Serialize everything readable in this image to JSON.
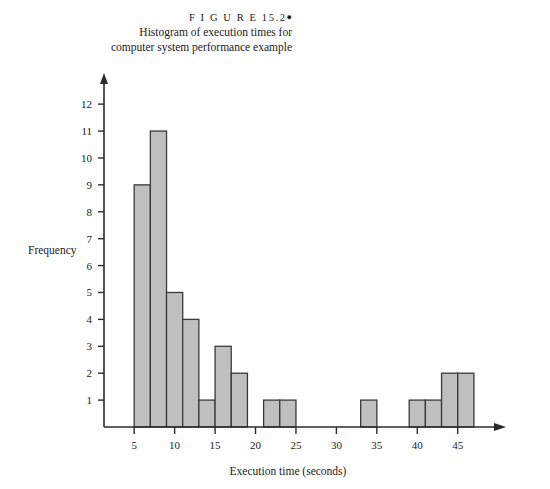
{
  "caption": {
    "figure_label": "F I G U R E  15.2",
    "bullet": "●",
    "line1": "Histogram of execution times for",
    "line2": "computer system performance example"
  },
  "colors": {
    "bar_fill": "#bfbfbf",
    "bar_stroke": "#3a3a3a",
    "axis": "#2b2b2b",
    "background": "#ffffff",
    "text": "#1a1a1a"
  },
  "chart_data": {
    "type": "bar",
    "title": "Histogram of execution times for computer system performance example",
    "xlabel": "Execution time (seconds)",
    "ylabel": "Frequency",
    "xlim": [
      3,
      48
    ],
    "ylim": [
      0,
      12.6
    ],
    "grid": false,
    "legend": null,
    "bin_width": 2,
    "xticks": [
      5,
      10,
      15,
      20,
      25,
      30,
      35,
      40,
      45
    ],
    "yticks": [
      1,
      2,
      3,
      4,
      5,
      6,
      7,
      8,
      9,
      10,
      11,
      12
    ],
    "bins": [
      {
        "start": 5,
        "end": 7,
        "value": 9
      },
      {
        "start": 7,
        "end": 9,
        "value": 11
      },
      {
        "start": 9,
        "end": 11,
        "value": 5
      },
      {
        "start": 11,
        "end": 13,
        "value": 4
      },
      {
        "start": 13,
        "end": 15,
        "value": 1
      },
      {
        "start": 15,
        "end": 17,
        "value": 3
      },
      {
        "start": 17,
        "end": 19,
        "value": 2
      },
      {
        "start": 21,
        "end": 23,
        "value": 1
      },
      {
        "start": 23,
        "end": 25,
        "value": 1
      },
      {
        "start": 33,
        "end": 35,
        "value": 1
      },
      {
        "start": 39,
        "end": 41,
        "value": 1
      },
      {
        "start": 41,
        "end": 43,
        "value": 1
      },
      {
        "start": 43,
        "end": 45,
        "value": 2
      },
      {
        "start": 45,
        "end": 47,
        "value": 2
      }
    ]
  }
}
